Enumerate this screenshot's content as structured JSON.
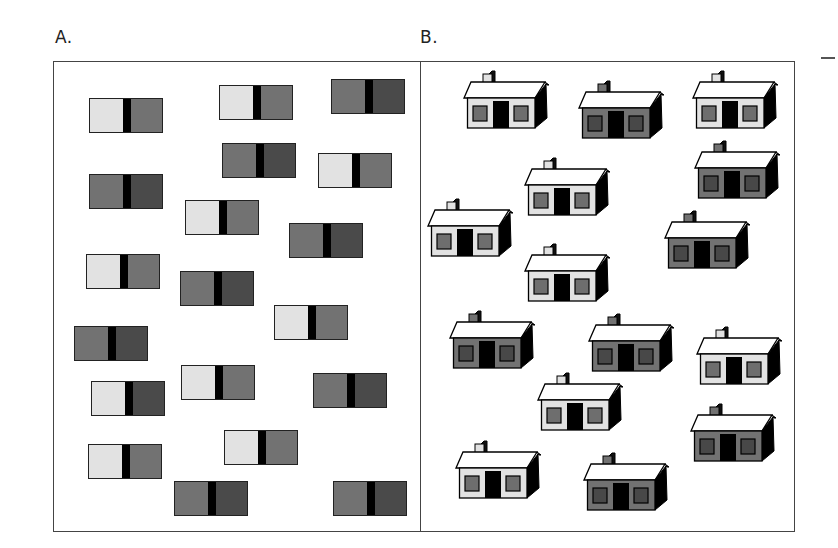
{
  "figure": {
    "labels": {
      "panel_a": "A.",
      "panel_b": "B."
    },
    "colors": {
      "light": "#e2e2e2",
      "mid": "#727272",
      "dark": "#4a4a4a",
      "divider": "#000000",
      "roof": "#ffffff",
      "house_side": "#000000",
      "light_window": "#6e6e6e",
      "dark_window": "#484848"
    }
  },
  "panel_a": {
    "tile_types": {
      "light-mid": {
        "left": "light",
        "right": "mid"
      },
      "mid-dark": {
        "left": "mid",
        "right": "dark"
      },
      "light-dark": {
        "left": "light",
        "right": "dark"
      }
    },
    "tiles": [
      {
        "x": 89,
        "y": 98,
        "type": "light-mid"
      },
      {
        "x": 219,
        "y": 85,
        "type": "light-mid"
      },
      {
        "x": 331,
        "y": 79,
        "type": "mid-dark"
      },
      {
        "x": 222,
        "y": 143,
        "type": "mid-dark"
      },
      {
        "x": 318,
        "y": 153,
        "type": "light-mid"
      },
      {
        "x": 89,
        "y": 174,
        "type": "mid-dark"
      },
      {
        "x": 185,
        "y": 200,
        "type": "light-mid"
      },
      {
        "x": 289,
        "y": 223,
        "type": "mid-dark"
      },
      {
        "x": 86,
        "y": 254,
        "type": "light-mid"
      },
      {
        "x": 180,
        "y": 271,
        "type": "mid-dark"
      },
      {
        "x": 274,
        "y": 305,
        "type": "light-mid"
      },
      {
        "x": 74,
        "y": 326,
        "type": "mid-dark"
      },
      {
        "x": 91,
        "y": 381,
        "type": "light-dark"
      },
      {
        "x": 181,
        "y": 365,
        "type": "light-mid"
      },
      {
        "x": 313,
        "y": 373,
        "type": "mid-dark"
      },
      {
        "x": 88,
        "y": 444,
        "type": "light-mid"
      },
      {
        "x": 224,
        "y": 430,
        "type": "light-mid"
      },
      {
        "x": 174,
        "y": 481,
        "type": "mid-dark"
      },
      {
        "x": 333,
        "y": 481,
        "type": "mid-dark"
      }
    ]
  },
  "panel_b": {
    "houses": [
      {
        "x": 463,
        "y": 70,
        "wall": "light"
      },
      {
        "x": 578,
        "y": 80,
        "wall": "dark"
      },
      {
        "x": 692,
        "y": 70,
        "wall": "light"
      },
      {
        "x": 524,
        "y": 157,
        "wall": "light"
      },
      {
        "x": 694,
        "y": 140,
        "wall": "dark"
      },
      {
        "x": 427,
        "y": 198,
        "wall": "light"
      },
      {
        "x": 664,
        "y": 210,
        "wall": "dark"
      },
      {
        "x": 524,
        "y": 243,
        "wall": "light"
      },
      {
        "x": 449,
        "y": 310,
        "wall": "dark"
      },
      {
        "x": 588,
        "y": 313,
        "wall": "dark"
      },
      {
        "x": 696,
        "y": 326,
        "wall": "light"
      },
      {
        "x": 537,
        "y": 372,
        "wall": "light"
      },
      {
        "x": 690,
        "y": 403,
        "wall": "dark"
      },
      {
        "x": 455,
        "y": 440,
        "wall": "light"
      },
      {
        "x": 583,
        "y": 452,
        "wall": "dark"
      }
    ]
  }
}
